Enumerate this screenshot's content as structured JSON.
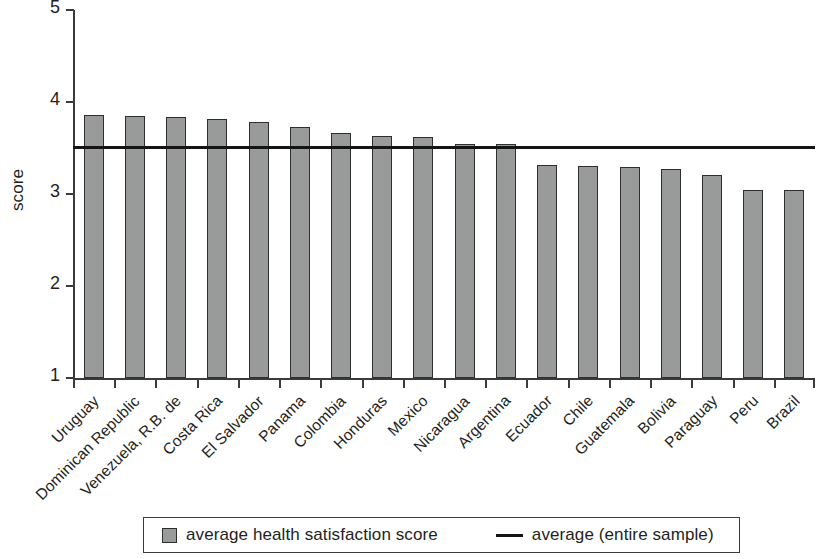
{
  "chart_data": {
    "type": "bar",
    "title": "",
    "xlabel": "",
    "ylabel": "score",
    "ylim": [
      1,
      5
    ],
    "yticks": [
      1,
      2,
      3,
      4,
      5
    ],
    "ytick_labels": [
      "1",
      "2",
      "3",
      "4",
      "5"
    ],
    "grid": false,
    "legend_position": "bottom",
    "categories": [
      "Uruguay",
      "Dominican Republic",
      "Venezuela, R.B. de",
      "Costa Rica",
      "El Salvador",
      "Panama",
      "Colombia",
      "Honduras",
      "Mexico",
      "Nicaragua",
      "Argentina",
      "Ecuador",
      "Chile",
      "Guatemala",
      "Bolivia",
      "Paraguay",
      "Peru",
      "Brazil"
    ],
    "series": [
      {
        "name": "average health satisfaction score",
        "type": "bar",
        "color": "#999a9a",
        "values": [
          3.86,
          3.85,
          3.84,
          3.82,
          3.78,
          3.73,
          3.66,
          3.63,
          3.62,
          3.54,
          3.54,
          3.32,
          3.3,
          3.29,
          3.27,
          3.21,
          3.04,
          3.04
        ]
      },
      {
        "name": "average (entire sample)",
        "type": "hline",
        "color": "#141414",
        "value": 3.51
      }
    ]
  },
  "legend": {
    "items": [
      {
        "label": "average health satisfaction score",
        "marker": "square-swatch",
        "color": "#999a9a"
      },
      {
        "label": "average (entire sample)",
        "marker": "line-dash",
        "color": "#141414"
      }
    ]
  },
  "axis": {
    "y_title": "score"
  }
}
